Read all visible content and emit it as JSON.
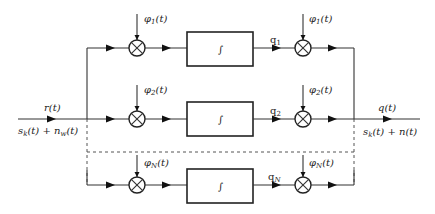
{
  "diagram": {
    "type": "correlator-bank block diagram",
    "input": {
      "signal_label": "r(t)",
      "expression": "s_k(t) + n_w(t)",
      "expr_parts": {
        "s": "s",
        "s_sub": "k",
        "mid": "(t) + n",
        "n_sub": "w",
        "tail": "(t)"
      }
    },
    "output": {
      "signal_label": "q(t)",
      "expression": "s_k(t) + n(t)",
      "expr_parts": {
        "s": "s",
        "s_sub": "k",
        "tail": "(t) + n(t)"
      }
    },
    "branches": [
      {
        "id": 1,
        "input_basis": {
          "phi": "φ",
          "sub": "1",
          "arg": "(t)"
        },
        "integrator_symbol": "∫",
        "output_coeff": {
          "q": "q",
          "sub": "1"
        },
        "output_basis": {
          "phi": "φ",
          "sub": "1",
          "arg": "(t)"
        }
      },
      {
        "id": 2,
        "input_basis": {
          "phi": "φ",
          "sub": "2",
          "arg": "(t)"
        },
        "integrator_symbol": "∫",
        "output_coeff": {
          "q": "q",
          "sub": "2"
        },
        "output_basis": {
          "phi": "φ",
          "sub": "2",
          "arg": "(t)"
        }
      },
      {
        "id": "N",
        "input_basis": {
          "phi": "φ",
          "sub": "N",
          "arg": "(t)"
        },
        "integrator_symbol": "∫",
        "output_coeff": {
          "q": "q",
          "sub": "N"
        },
        "output_basis": {
          "phi": "φ",
          "sub": "N",
          "arg": "(t)"
        }
      }
    ],
    "multiplier_symbol": "⊗",
    "ellipsis_style": "dashed"
  }
}
